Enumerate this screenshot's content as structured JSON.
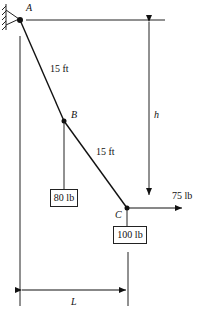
{
  "diagram": {
    "points": {
      "A": "A",
      "B": "B",
      "C": "C"
    },
    "segments": {
      "AB_length": "15 ft",
      "BC_length": "15 ft"
    },
    "loads": {
      "B_weight": "80 lb",
      "C_weight": "100 lb",
      "C_horizontal_force": "75 lb"
    },
    "dimensions": {
      "vertical": "h",
      "horizontal": "L"
    },
    "support": "pin-support-wall"
  }
}
